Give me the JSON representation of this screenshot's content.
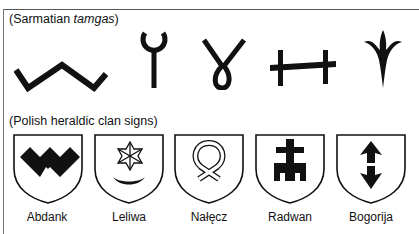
{
  "sections": {
    "sarmatian": {
      "heading_prefix": "(Sarmatian ",
      "heading_italic": "tamgas",
      "heading_suffix": ")",
      "tamgas": [
        {
          "name": "zigzag-tamga"
        },
        {
          "name": "ring-stem-tamga"
        },
        {
          "name": "loop-y-tamga"
        },
        {
          "name": "h-bar-tamga"
        },
        {
          "name": "trident-flower-tamga"
        }
      ]
    },
    "polish": {
      "heading": "(Polish heraldic clan signs)",
      "shields": [
        {
          "label": "Abdank",
          "charge": "w-chevron"
        },
        {
          "label": "Leliwa",
          "charge": "star-crescent"
        },
        {
          "label": "Nałęcz",
          "charge": "knotted-ribbon"
        },
        {
          "label": "Radwan",
          "charge": "cross-banner"
        },
        {
          "label": "Bogorija",
          "charge": "double-arrow"
        }
      ]
    }
  },
  "colors": {
    "ink": "#111111",
    "frame": "#555555",
    "background": "#ffffff"
  }
}
